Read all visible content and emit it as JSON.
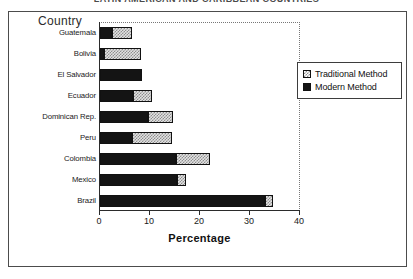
{
  "chart_data": {
    "type": "bar",
    "orientation": "horizontal",
    "stacked": true,
    "title": "LATIN AMERICAN AND CARIBBEAN COUNTRIES",
    "xlabel": "Percentage",
    "ylabel": "Country",
    "xlim": [
      0,
      40
    ],
    "xticks": [
      0,
      10,
      20,
      30,
      40
    ],
    "xtick_labels": [
      "0",
      "10",
      "20",
      "30",
      "40"
    ],
    "grid": false,
    "legend_position": "right",
    "categories": [
      "Guatemala",
      "Bolivia",
      "El Salvador",
      "Ecuador",
      "Dominican Rep.",
      "Peru",
      "Colombia",
      "Mexico",
      "Brazil"
    ],
    "series": [
      {
        "name": "Modern Method",
        "color": "#141414",
        "values": [
          2.4,
          0.8,
          8.4,
          6.6,
          9.6,
          6.4,
          15.2,
          15.4,
          33.0
        ]
      },
      {
        "name": "Traditional Method",
        "color": "#e2e2e2",
        "values": [
          4.0,
          7.4,
          0.0,
          3.8,
          5.0,
          8.0,
          6.8,
          1.8,
          1.6
        ]
      }
    ],
    "totals": [
      6.4,
      8.2,
      8.4,
      10.4,
      14.6,
      14.4,
      22.0,
      17.2,
      34.6
    ]
  },
  "legend": {
    "items": [
      {
        "label": "Traditional Method",
        "swatch": "traditional-swatch"
      },
      {
        "label": "Modern Method",
        "swatch": "modern-swatch"
      }
    ]
  }
}
